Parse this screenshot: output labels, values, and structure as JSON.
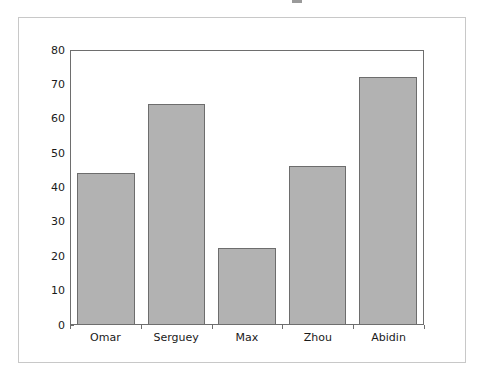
{
  "figure": {
    "background_color": "#ffffff",
    "frame_color": "#c8c8c8",
    "axes_edge_color": "#6e6e6e"
  },
  "chart_data": {
    "type": "bar",
    "title": "",
    "subtitle": "",
    "xlabel": "",
    "ylabel": "",
    "categories": [
      "Omar",
      "Serguey",
      "Max",
      "Zhou",
      "Abidin"
    ],
    "values": [
      44,
      64,
      22,
      46,
      72
    ],
    "series": [
      {
        "name": "",
        "values": [
          44,
          64,
          22,
          46,
          72
        ]
      }
    ],
    "ylim": [
      0,
      80
    ],
    "xlim": [
      0,
      5
    ],
    "y_ticks": [
      0,
      10,
      20,
      30,
      40,
      50,
      60,
      70,
      80
    ],
    "y_tick_labels": [
      "0",
      "10",
      "20",
      "30",
      "40",
      "50",
      "60",
      "70",
      "80"
    ],
    "x_tick_labels": [
      "Omar",
      "Serguey",
      "Max",
      "Zhou",
      "Abidin"
    ],
    "grid": false,
    "legend": null,
    "legend_position": "none",
    "annotations": [],
    "bar_fill_color": "#b2b2b2",
    "bar_edge_color": "#6d6d6d",
    "bar_width_fraction": 0.82
  }
}
